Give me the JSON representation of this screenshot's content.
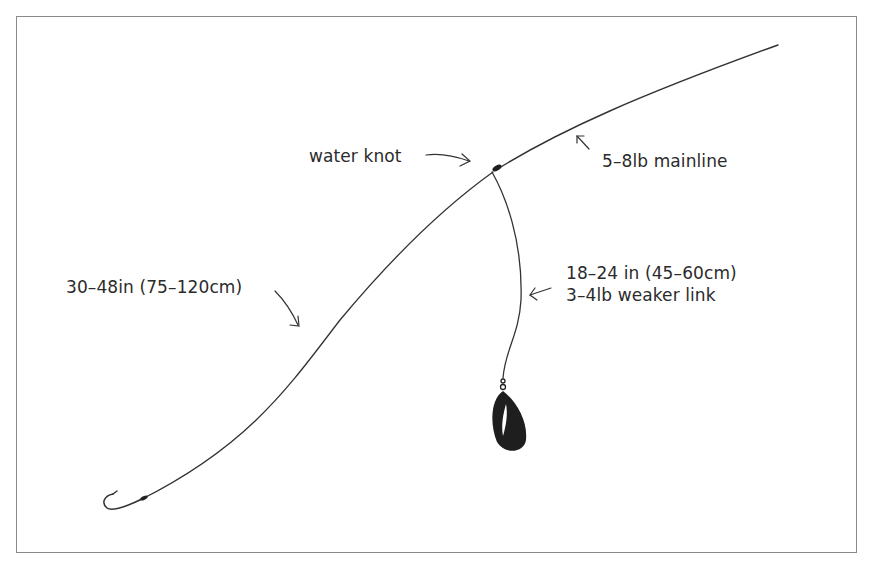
{
  "diagram": {
    "title": "",
    "type": "fishing rig diagram",
    "colors": {
      "background": "#ffffff",
      "frame": "#8a8a8a",
      "line": "#333333",
      "weight": "#1e1e1e"
    },
    "labels": {
      "water_knot": "water knot",
      "mainline": "5–8lb mainline",
      "hooklength": "30–48in (75–120cm)",
      "weak_link_length": "18–24 in (45–60cm)",
      "weak_link_strength": "3–4lb weaker link"
    },
    "components": [
      {
        "name": "mainline",
        "description": "line running from top-right to water knot"
      },
      {
        "name": "water-knot",
        "description": "knot joining mainline, hooklength and weak link"
      },
      {
        "name": "hooklength",
        "description": "long curved line ending in a hook at bottom-left"
      },
      {
        "name": "hook",
        "description": "hook at end of hooklength"
      },
      {
        "name": "weak-link",
        "description": "dropper line from knot down to weight"
      },
      {
        "name": "weight",
        "description": "teardrop-shaped lead weight with swivel"
      }
    ]
  }
}
